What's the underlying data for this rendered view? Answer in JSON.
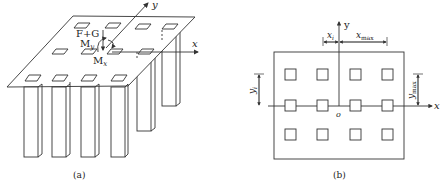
{
  "panel_a": {
    "caption": "(a)",
    "labels": {
      "load": "F+G",
      "moment_y": "M",
      "moment_y_sub": "y",
      "moment_x": "M",
      "moment_x_sub": "x",
      "axis_x": "x",
      "axis_y": "y"
    }
  },
  "panel_b": {
    "caption": "(b)",
    "labels": {
      "axis_x": "x",
      "axis_y": "y",
      "origin": "o",
      "xi": "x",
      "xi_sub": "i",
      "xmax": "x",
      "xmax_sub": "max",
      "yi": "y",
      "yi_sub": "i",
      "ymax": "y",
      "ymax_sub": "max"
    },
    "grid": {
      "rows": 3,
      "cols": 4
    }
  },
  "colors": {
    "line": "#333333",
    "background": "#ffffff"
  }
}
